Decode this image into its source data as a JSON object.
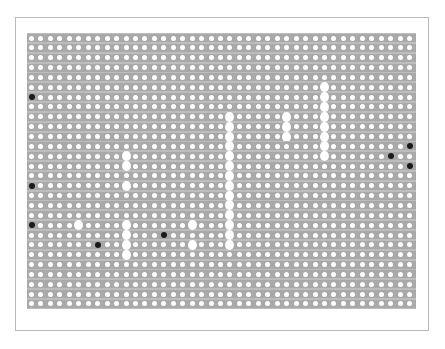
{
  "caption": "",
  "grid": {
    "rows": 28,
    "cols": 41,
    "origin_x": 27,
    "origin_y": 33,
    "col_pitch": 9.45,
    "row_pitch": 9.85,
    "row_width": 389,
    "colors": {
      "strip": "#a9a9a9",
      "strip_border": "#bdbdbd",
      "hole": "#ffffff",
      "black_marker": "#1a1a1a",
      "white_marker": "#ffffff"
    }
  },
  "black_markers": [
    {
      "row": 6,
      "col": 0
    },
    {
      "row": 15,
      "col": 0
    },
    {
      "row": 19,
      "col": 0
    },
    {
      "row": 21,
      "col": 7
    },
    {
      "row": 20,
      "col": 14
    },
    {
      "row": 11,
      "col": 40
    },
    {
      "row": 12,
      "col": 38
    },
    {
      "row": 13,
      "col": 40
    }
  ],
  "white_markers": [
    {
      "row": 12,
      "col": 10
    },
    {
      "row": 13,
      "col": 10
    },
    {
      "row": 15,
      "col": 10
    },
    {
      "row": 19,
      "col": 10
    },
    {
      "row": 20,
      "col": 10
    },
    {
      "row": 21,
      "col": 10
    },
    {
      "row": 22,
      "col": 10
    },
    {
      "row": 19,
      "col": 5
    },
    {
      "row": 19,
      "col": 17
    },
    {
      "row": 21,
      "col": 17
    },
    {
      "row": 8,
      "col": 21
    },
    {
      "row": 9,
      "col": 21
    },
    {
      "row": 10,
      "col": 21
    },
    {
      "row": 11,
      "col": 21
    },
    {
      "row": 12,
      "col": 21
    },
    {
      "row": 13,
      "col": 21
    },
    {
      "row": 14,
      "col": 21
    },
    {
      "row": 15,
      "col": 21
    },
    {
      "row": 16,
      "col": 21
    },
    {
      "row": 17,
      "col": 21
    },
    {
      "row": 18,
      "col": 21
    },
    {
      "row": 19,
      "col": 21
    },
    {
      "row": 20,
      "col": 21
    },
    {
      "row": 21,
      "col": 21
    },
    {
      "row": 8,
      "col": 27
    },
    {
      "row": 9,
      "col": 27
    },
    {
      "row": 10,
      "col": 27
    },
    {
      "row": 5,
      "col": 31
    },
    {
      "row": 6,
      "col": 31
    },
    {
      "row": 7,
      "col": 31
    },
    {
      "row": 8,
      "col": 31
    },
    {
      "row": 9,
      "col": 31
    },
    {
      "row": 10,
      "col": 31
    },
    {
      "row": 11,
      "col": 31
    },
    {
      "row": 12,
      "col": 31
    }
  ]
}
